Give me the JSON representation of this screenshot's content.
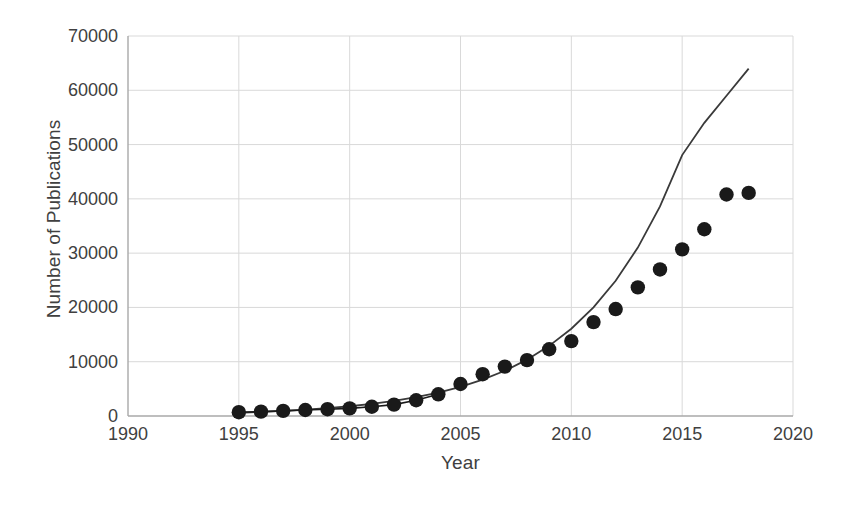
{
  "chart_data": {
    "type": "scatter",
    "title": "",
    "xlabel": "Year",
    "ylabel": "Number of Publications",
    "xlim": [
      1990,
      2020
    ],
    "ylim": [
      0,
      70000
    ],
    "xticks": [
      1990,
      1995,
      2000,
      2005,
      2010,
      2015,
      2020
    ],
    "yticks": [
      0,
      10000,
      20000,
      30000,
      40000,
      50000,
      60000,
      70000
    ],
    "grid": true,
    "legend": "none",
    "marker_color": "#1a1a1a",
    "line_color": "#3a3a3a",
    "series": [
      {
        "name": "Number of Publications",
        "style": "markers",
        "x": [
          1995,
          1996,
          1997,
          1998,
          1999,
          2000,
          2001,
          2002,
          2003,
          2004,
          2005,
          2006,
          2007,
          2008,
          2009,
          2010,
          2011,
          2012,
          2013,
          2014,
          2015,
          2016,
          2017,
          2018
        ],
        "values": [
          700,
          800,
          950,
          1100,
          1250,
          1400,
          1700,
          2100,
          2900,
          4000,
          5900,
          7700,
          9100,
          10300,
          12300,
          13800,
          17300,
          19700,
          23700,
          27000,
          30700,
          34400,
          40800,
          41100
        ]
      },
      {
        "name": "Exponential fit",
        "style": "line",
        "x": [
          1995,
          1996,
          1997,
          1998,
          1999,
          2000,
          2001,
          2002,
          2003,
          2004,
          2005,
          2006,
          2007,
          2008,
          2009,
          2010,
          2011,
          2012,
          2013,
          2014,
          2015,
          2016,
          2017,
          2018
        ],
        "values": [
          600,
          750,
          930,
          1160,
          1440,
          1800,
          2240,
          2790,
          3470,
          4320,
          5380,
          6700,
          8340,
          10380,
          12920,
          16080,
          20020,
          24920,
          31020,
          38610,
          48060,
          54000,
          59000,
          64000
        ]
      }
    ]
  },
  "axes": {
    "y_title": "Number of Publications",
    "x_title": "Year",
    "y_tick_labels": [
      "0",
      "10000",
      "20000",
      "30000",
      "40000",
      "50000",
      "60000",
      "70000"
    ],
    "x_tick_labels": [
      "1990",
      "1995",
      "2000",
      "2005",
      "2010",
      "2015",
      "2020"
    ]
  }
}
